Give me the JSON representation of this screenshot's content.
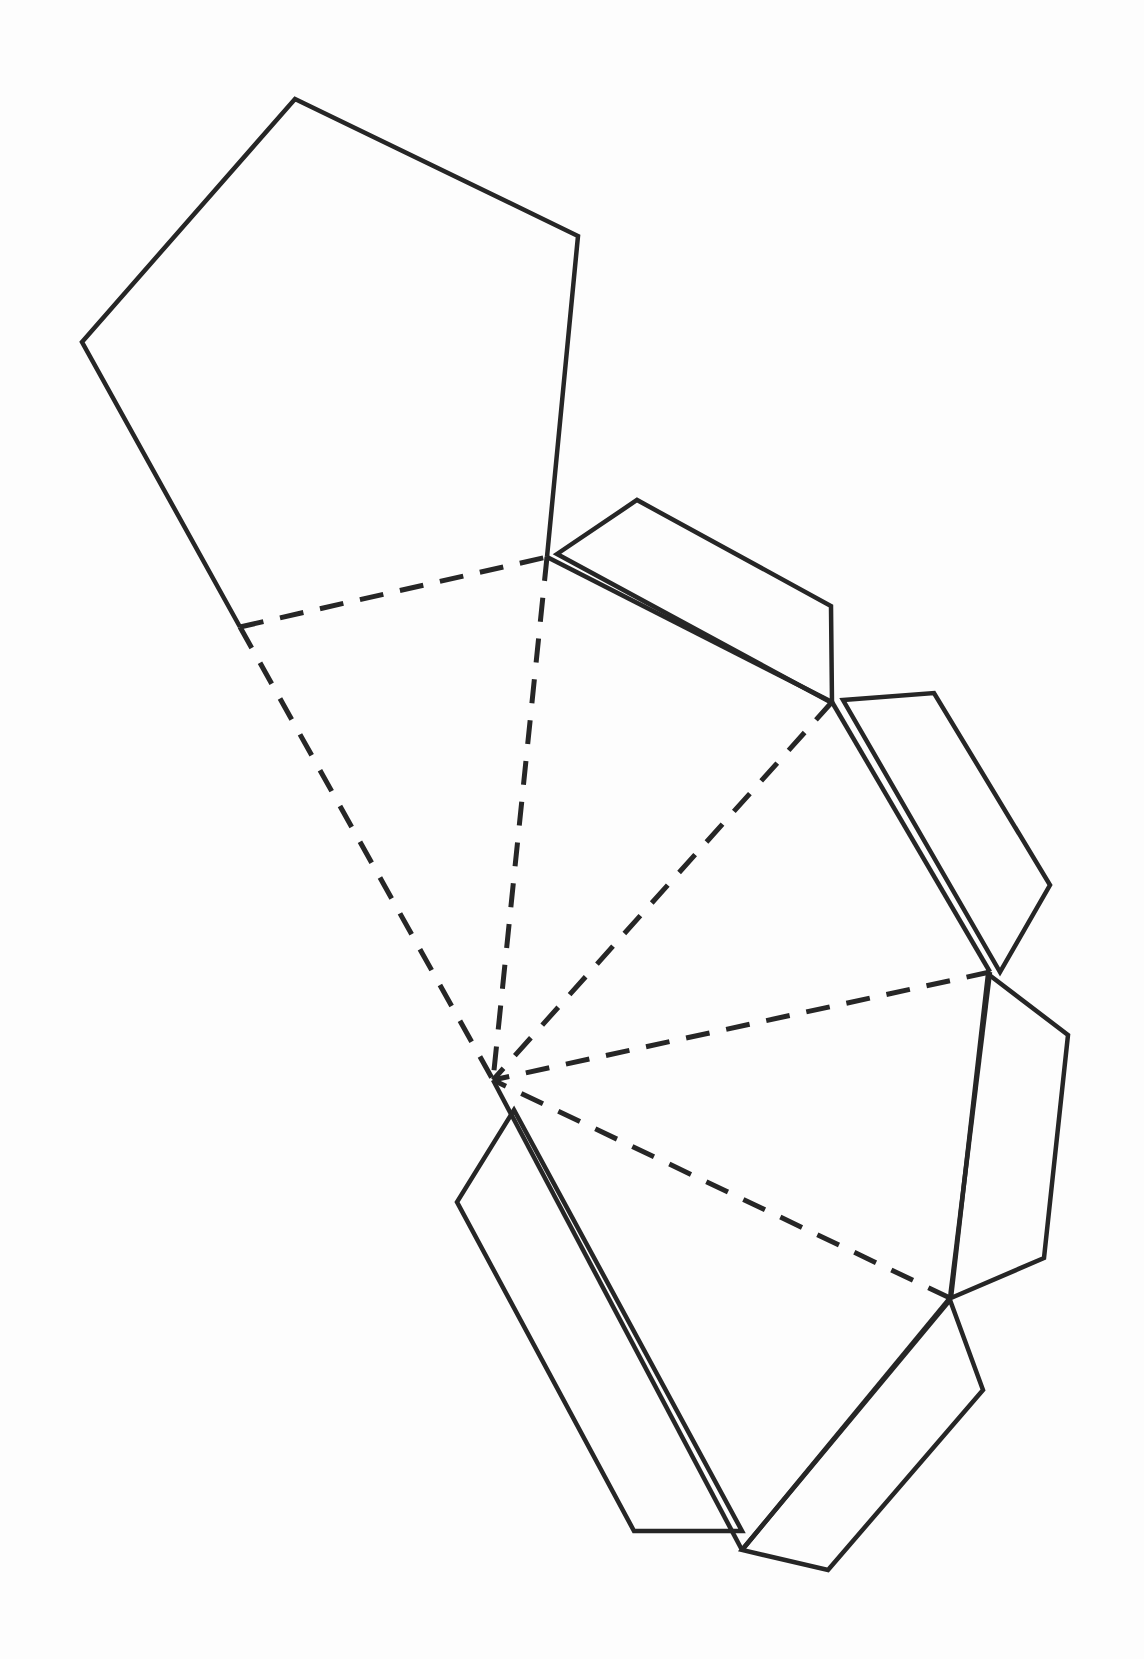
{
  "diagram": {
    "type": "net",
    "background": "#fdfdfd",
    "stroke_color": "#262626",
    "base_pentagon": {
      "points": [
        [
          295,
          99
        ],
        [
          578,
          236
        ],
        [
          547,
          557
        ],
        [
          240,
          627
        ],
        [
          82,
          342
        ]
      ],
      "style": "solid"
    },
    "apex": [
      493,
      1080
    ],
    "fold_lines": [
      {
        "from": [
          240,
          627
        ],
        "to": [
          547,
          557
        ]
      },
      {
        "from": [
          240,
          627
        ],
        "to": [
          493,
          1080
        ]
      },
      {
        "from": [
          547,
          557
        ],
        "to": [
          493,
          1080
        ]
      },
      {
        "from": [
          832,
          702
        ],
        "to": [
          493,
          1080
        ]
      },
      {
        "from": [
          990,
          972
        ],
        "to": [
          493,
          1080
        ]
      },
      {
        "from": [
          950,
          1298
        ],
        "to": [
          493,
          1080
        ]
      }
    ],
    "outer_edges": [
      {
        "from": [
          547,
          557
        ],
        "to": [
          832,
          702
        ]
      },
      {
        "from": [
          832,
          702
        ],
        "to": [
          990,
          972
        ]
      },
      {
        "from": [
          990,
          972
        ],
        "to": [
          950,
          1298
        ]
      },
      {
        "from": [
          950,
          1298
        ],
        "to": [
          742,
          1550
        ]
      },
      {
        "from": [
          742,
          1550
        ],
        "to": [
          493,
          1080
        ]
      }
    ],
    "tabs": [
      {
        "name": "tab-1",
        "points": [
          [
            557,
            554
          ],
          [
            637,
            500
          ],
          [
            831,
            606
          ],
          [
            832,
            703
          ]
        ]
      },
      {
        "name": "tab-2",
        "points": [
          [
            843,
            700
          ],
          [
            934,
            693
          ],
          [
            1050,
            885
          ],
          [
            1000,
            972
          ]
        ]
      },
      {
        "name": "tab-3",
        "points": [
          [
            988,
            974
          ],
          [
            1068,
            1035
          ],
          [
            1044,
            1258
          ],
          [
            951,
            1298
          ]
        ]
      },
      {
        "name": "tab-4",
        "points": [
          [
            950,
            1300
          ],
          [
            983,
            1390
          ],
          [
            828,
            1570
          ],
          [
            742,
            1550
          ]
        ]
      },
      {
        "name": "tab-5",
        "points": [
          [
            514,
            1110
          ],
          [
            457,
            1202
          ],
          [
            634,
            1531
          ],
          [
            742,
            1531
          ]
        ]
      }
    ],
    "triangular_faces": 5,
    "labels": []
  }
}
